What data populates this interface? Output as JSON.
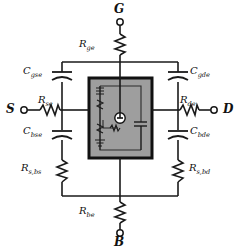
{
  "figure": {
    "type": "mosfet-small-signal-equivalent-circuit",
    "background": "#ffffff",
    "line_color": "#1a1a1a",
    "intrinsic_box_fill": "#9e9e9e",
    "intrinsic_box_border": "#111111"
  },
  "terminals": [
    {
      "id": "gate",
      "label": "G",
      "position": "top"
    },
    {
      "id": "source",
      "label": "S",
      "position": "left"
    },
    {
      "id": "drain",
      "label": "D",
      "position": "right"
    },
    {
      "id": "bulk",
      "label": "B",
      "position": "bottom"
    }
  ],
  "resistors": [
    {
      "id": "r-ge",
      "base": "R",
      "sub": "ge",
      "label": "R_ge"
    },
    {
      "id": "r-se",
      "base": "R",
      "sub": "se",
      "label": "R_se"
    },
    {
      "id": "r-de",
      "base": "R",
      "sub": "de",
      "label": "R_de"
    },
    {
      "id": "r-be",
      "base": "R",
      "sub": "be",
      "label": "R_be"
    },
    {
      "id": "r-s-bs",
      "base": "R",
      "sub": "s,bs",
      "label": "R_s,bs"
    },
    {
      "id": "r-s-bd",
      "base": "R",
      "sub": "s,bd",
      "label": "R_s,bd"
    }
  ],
  "capacitors": [
    {
      "id": "c-gse",
      "base": "C",
      "sub": "gse",
      "label": "C_gse"
    },
    {
      "id": "c-gde",
      "base": "C",
      "sub": "gde",
      "label": "C_gde"
    },
    {
      "id": "c-bse",
      "base": "C",
      "sub": "bse",
      "label": "C_bse"
    },
    {
      "id": "c-bde",
      "base": "C",
      "sub": "bde",
      "label": "C_bde"
    }
  ],
  "intrinsic_core": {
    "description": "intrinsic device region",
    "elements": [
      "current-source",
      "inner-capacitor",
      "inner-diodes",
      "inner-ground"
    ]
  }
}
